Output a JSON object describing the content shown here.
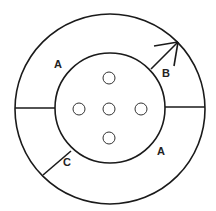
{
  "diagram": {
    "stroke_color": "#1a1a1a",
    "background": "#ffffff",
    "outer_circle": {
      "cx": 110,
      "cy": 109,
      "r": 95
    },
    "inner_circle": {
      "cx": 110,
      "cy": 108,
      "r": 55
    },
    "holes": [
      {
        "name": "top",
        "cx": 109,
        "cy": 78,
        "r": 6
      },
      {
        "name": "left",
        "cx": 79,
        "cy": 109,
        "r": 6
      },
      {
        "name": "center",
        "cx": 109,
        "cy": 109,
        "r": 6
      },
      {
        "name": "right",
        "cx": 141,
        "cy": 109,
        "r": 6
      },
      {
        "name": "bottom",
        "cx": 109,
        "cy": 138,
        "r": 6
      }
    ],
    "labels": {
      "a_top": "A",
      "a_bottom": "A",
      "b": "B",
      "c": "C"
    }
  }
}
